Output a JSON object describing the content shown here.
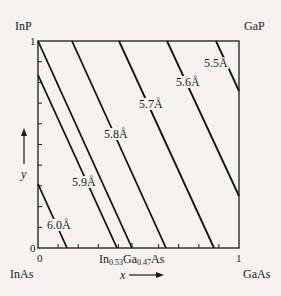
{
  "corners": {
    "top_left": "InP",
    "top_right": "GaP",
    "bottom_left": "InAs",
    "bottom_right": "GaAs"
  },
  "axes": {
    "x_var": "x",
    "y_var": "y",
    "x_tick_start": "0",
    "x_tick_end": "1",
    "y_tick_start": "0",
    "y_tick_end": "1"
  },
  "composition_marker": {
    "prefix": "In",
    "in_sub": "0.53",
    "mid": "Ga",
    "ga_sub": "0.47",
    "suffix": "As"
  },
  "lattice_lines": [
    {
      "label": "6.0Å"
    },
    {
      "label": "5.9Å"
    },
    {
      "label": "5.8Å"
    },
    {
      "label": "5.7Å"
    },
    {
      "label": "5.6Å"
    },
    {
      "label": "5.5Å"
    }
  ],
  "colors": {
    "background": "#f4f3f0",
    "ink": "#1a1a1a"
  }
}
